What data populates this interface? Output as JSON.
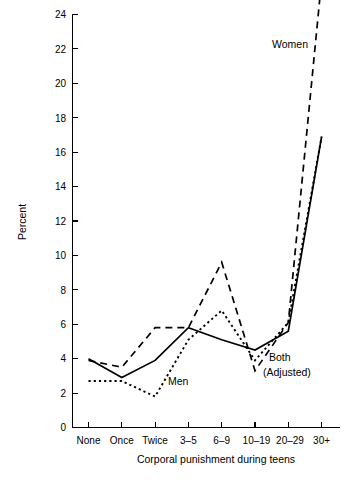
{
  "chart_data": {
    "type": "line",
    "title": "",
    "xlabel": "Corporal punishment during teens",
    "ylabel": "Percent",
    "categories": [
      "None",
      "Once",
      "Twice",
      "3–5",
      "6–9",
      "10–19",
      "20–29",
      "30+"
    ],
    "ylim": [
      0,
      24
    ],
    "xlim": [
      0,
      7
    ],
    "ytick_step": 2,
    "yticks": [
      0,
      2,
      4,
      6,
      8,
      10,
      12,
      14,
      16,
      18,
      20,
      22,
      24
    ],
    "ytick_labels": [
      "0",
      "2",
      "4",
      "6",
      "8",
      "10",
      "12",
      "14",
      "16",
      "18",
      "20",
      "22",
      "24"
    ],
    "grid": false,
    "legend_position": "inline-annotations",
    "series": [
      {
        "name": "Both (Adjusted)",
        "style": "solid",
        "values": [
          4.0,
          2.9,
          3.9,
          5.8,
          5.1,
          4.5,
          5.6,
          16.9
        ]
      },
      {
        "name": "Women",
        "style": "dashed",
        "values": [
          3.9,
          3.5,
          5.8,
          5.8,
          9.6,
          3.3,
          6.1,
          26.0
        ],
        "note": "Final value at 30+ extends above the top of the plotting area (clipped at 24)"
      },
      {
        "name": "Men",
        "style": "dotted",
        "values": [
          2.7,
          2.7,
          1.8,
          5.1,
          6.8,
          3.9,
          6.1,
          16.9
        ]
      }
    ],
    "annotations": [
      {
        "text": "Women",
        "series": "Women"
      },
      {
        "text": "Men",
        "series": "Men"
      },
      {
        "text": "Both",
        "series": "Both (Adjusted)"
      },
      {
        "text": "(Adjusted)",
        "series": "Both (Adjusted)"
      }
    ]
  },
  "axes": {
    "y_axis_title": "Percent",
    "x_axis_title": "Corporal punishment during teens"
  },
  "labels": {
    "women": "Women",
    "men": "Men",
    "both_line1": "Both",
    "both_line2": "(Adjusted)"
  },
  "colors": {
    "background": "#ffffff",
    "ink": "#000000"
  }
}
